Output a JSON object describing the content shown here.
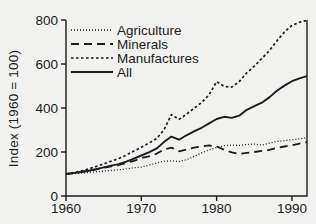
{
  "figure": {
    "background": "#f1f1ef",
    "ink": "#1c1c1c"
  },
  "chart_data": {
    "type": "line",
    "title": "",
    "xlabel": "",
    "ylabel": "Index (1960 = 100)",
    "ylim": [
      0,
      800
    ],
    "yticks": [
      0,
      200,
      400,
      600,
      800
    ],
    "xlim": [
      1960,
      1992
    ],
    "xticks": [
      1960,
      1970,
      1980,
      1990
    ],
    "grid": false,
    "legend_position": "inside-top-left",
    "x": [
      1960,
      1961,
      1962,
      1963,
      1964,
      1965,
      1966,
      1967,
      1968,
      1969,
      1970,
      1971,
      1972,
      1973,
      1974,
      1975,
      1976,
      1977,
      1978,
      1979,
      1980,
      1981,
      1982,
      1983,
      1984,
      1985,
      1986,
      1987,
      1988,
      1989,
      1990,
      1991,
      1992
    ],
    "series": [
      {
        "name": "Agriculture",
        "style": "fine-dotted",
        "values": [
          100,
          102,
          104,
          107,
          110,
          113,
          116,
          119,
          123,
          128,
          132,
          140,
          150,
          158,
          160,
          157,
          165,
          180,
          196,
          210,
          220,
          228,
          232,
          230,
          234,
          236,
          232,
          240,
          248,
          252,
          256,
          260,
          265
        ]
      },
      {
        "name": "Minerals",
        "style": "long-dash",
        "values": [
          100,
          104,
          109,
          115,
          121,
          128,
          135,
          141,
          150,
          160,
          172,
          180,
          192,
          212,
          220,
          203,
          212,
          220,
          226,
          230,
          225,
          210,
          198,
          192,
          196,
          200,
          205,
          210,
          218,
          225,
          231,
          238,
          245
        ]
      },
      {
        "name": "Manufactures",
        "style": "short-dash",
        "values": [
          100,
          106,
          113,
          123,
          134,
          146,
          158,
          170,
          186,
          204,
          222,
          240,
          260,
          300,
          370,
          348,
          372,
          398,
          425,
          460,
          520,
          498,
          495,
          520,
          560,
          590,
          625,
          660,
          705,
          745,
          775,
          790,
          798
        ]
      },
      {
        "name": "All",
        "style": "solid",
        "values": [
          100,
          104,
          109,
          115,
          122,
          130,
          138,
          145,
          156,
          170,
          184,
          198,
          215,
          245,
          270,
          256,
          276,
          294,
          310,
          330,
          350,
          360,
          355,
          365,
          392,
          408,
          424,
          448,
          478,
          502,
          522,
          535,
          545
        ]
      }
    ]
  }
}
